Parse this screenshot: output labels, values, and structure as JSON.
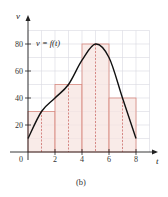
{
  "chart_data": {
    "type": "bar",
    "title": "",
    "caption": "(b)",
    "xlabel": "t",
    "ylabel": "v",
    "function_label": "v = f(t)",
    "xlim": [
      0,
      8.5
    ],
    "ylim": [
      0,
      90
    ],
    "x_ticks": [
      0,
      2,
      4,
      6,
      8
    ],
    "x_tick_labels": [
      "0",
      "2",
      "4",
      "6",
      "8"
    ],
    "y_ticks": [
      20,
      40,
      60,
      80
    ],
    "y_tick_labels": [
      "20",
      "40",
      "60",
      "80"
    ],
    "grid": true,
    "rectangles": [
      {
        "x_start": 0,
        "x_end": 2,
        "midpoint": 1,
        "height": 30
      },
      {
        "x_start": 2,
        "x_end": 4,
        "midpoint": 3,
        "height": 50
      },
      {
        "x_start": 4,
        "x_end": 6,
        "midpoint": 5,
        "height": 80
      },
      {
        "x_start": 6,
        "x_end": 8,
        "midpoint": 7,
        "height": 40
      }
    ],
    "curve": {
      "name": "v = f(t)",
      "x": [
        0,
        1,
        2,
        3,
        4,
        5,
        6,
        7,
        8
      ],
      "y": [
        10,
        30,
        40,
        50,
        68,
        80,
        70,
        40,
        10
      ]
    },
    "colors": {
      "rect_fill": "#f7e4e0",
      "rect_stroke": "#d98a80",
      "grid": "#d9d9e0",
      "curve": "#111111",
      "dashed": "#c9605a"
    }
  }
}
